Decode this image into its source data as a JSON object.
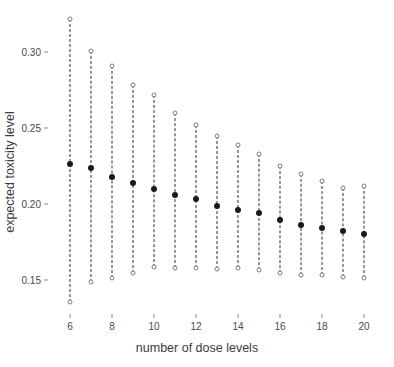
{
  "chart_data": {
    "type": "scatter",
    "title": "",
    "xlabel": "number of dose levels",
    "ylabel": "expected toxicity level",
    "xlim": [
      5.2,
      20.8
    ],
    "ylim": [
      0.132,
      0.327
    ],
    "grid": false,
    "legend": null,
    "x_ticks": [
      6,
      8,
      10,
      12,
      14,
      16,
      18,
      20
    ],
    "x_tick_labels": [
      "6",
      "8",
      "10",
      "12",
      "14",
      "16",
      "18",
      "20"
    ],
    "y_ticks": [
      0.15,
      0.2,
      0.25,
      0.3
    ],
    "y_tick_labels": [
      "0.15",
      "0.20",
      "0.25",
      "0.30"
    ],
    "x": [
      6,
      7,
      8,
      9,
      10,
      11,
      12,
      13,
      14,
      15,
      16,
      17,
      18,
      19,
      20
    ],
    "series": [
      {
        "name": "upper bound",
        "marker": "open-circle",
        "color": "#7d7d7d",
        "values": [
          0.3215,
          0.3005,
          0.2905,
          0.2785,
          0.2715,
          0.26,
          0.252,
          0.245,
          0.239,
          0.233,
          0.225,
          0.2195,
          0.215,
          0.2105,
          0.212
        ]
      },
      {
        "name": "expected toxicity",
        "marker": "filled-circle",
        "color": "#1a1a1a",
        "values": [
          0.2265,
          0.224,
          0.2175,
          0.214,
          0.21,
          0.206,
          0.2035,
          0.1985,
          0.196,
          0.194,
          0.1895,
          0.1865,
          0.184,
          0.182,
          0.18
        ]
      },
      {
        "name": "lower bound",
        "marker": "open-circle",
        "color": "#7d7d7d",
        "values": [
          0.1355,
          0.149,
          0.151,
          0.1545,
          0.1585,
          0.158,
          0.158,
          0.1575,
          0.158,
          0.1565,
          0.1545,
          0.1535,
          0.153,
          0.152,
          0.1515
        ]
      }
    ],
    "connector": {
      "style": "dashed",
      "color": "#2e2e2e",
      "description": "vertical dashed line from lower bound to upper bound at each x"
    }
  }
}
